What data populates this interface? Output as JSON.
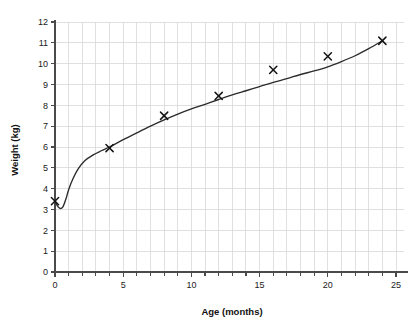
{
  "chart_data": {
    "type": "scatter",
    "title": "",
    "subtitle": "",
    "xlabel": "Age (months)",
    "ylabel": "Weight (kg)",
    "xlim": [
      0,
      25.6
    ],
    "ylim": [
      0,
      12.3
    ],
    "x_major_ticks": [
      0,
      5,
      10,
      15,
      20,
      25
    ],
    "x_minor_step": 1,
    "y_major_ticks": [
      0,
      1,
      2,
      3,
      4,
      5,
      6,
      7,
      8,
      9,
      10,
      11,
      12
    ],
    "x_tick_labels": [
      "0",
      "5",
      "10",
      "15",
      "20",
      "25"
    ],
    "y_tick_labels": [
      "0",
      "1",
      "2",
      "3",
      "4",
      "5",
      "6",
      "7",
      "8",
      "9",
      "10",
      "11",
      "12"
    ],
    "grid": true,
    "grid_x_step": 1,
    "grid_y_step": 1,
    "legend": "none",
    "series": [
      {
        "name": "Measured weight",
        "marker": "x",
        "x": [
          0,
          4,
          8,
          12,
          16,
          20,
          24
        ],
        "values": [
          3.4,
          5.95,
          7.5,
          8.45,
          9.7,
          10.35,
          11.1
        ]
      },
      {
        "name": "Fitted growth curve",
        "type": "line",
        "x": [
          0,
          0.15,
          0.3,
          0.45,
          0.6,
          0.8,
          1.0,
          1.3,
          1.7,
          2.2,
          2.8,
          3.4,
          4.0,
          5.0,
          6.0,
          7.0,
          8.0,
          9.0,
          10.0,
          11.0,
          12.0,
          13.0,
          14.0,
          15.0,
          16.0,
          17.0,
          18.0,
          19.0,
          20.0,
          21.0,
          22.0,
          23.0,
          24.0
        ],
        "values": [
          3.4,
          3.2,
          3.08,
          3.05,
          3.15,
          3.5,
          3.95,
          4.45,
          4.95,
          5.35,
          5.62,
          5.82,
          6.0,
          6.35,
          6.68,
          7.0,
          7.3,
          7.58,
          7.83,
          8.05,
          8.28,
          8.5,
          8.7,
          8.9,
          9.1,
          9.28,
          9.48,
          9.65,
          9.85,
          10.1,
          10.38,
          10.72,
          11.1
        ]
      }
    ]
  },
  "axis_colors": {
    "grid": "#d8d8d8",
    "axis": "#4a4a4a",
    "curve": "#2b2b2b",
    "marker": "#141414",
    "text": "#1a1a1a",
    "background": "#ffffff"
  }
}
